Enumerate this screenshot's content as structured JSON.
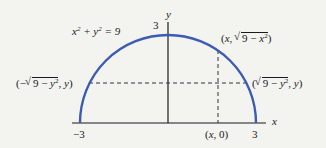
{
  "diagram": {
    "type": "semicircle-region",
    "equation": "x² + y² = 9",
    "radius": 3,
    "colors": {
      "curve": "#3b5bb5",
      "axes": "#1a1a1a",
      "dashed": "#333333",
      "background": "#f3f3f0"
    },
    "axes": {
      "x_label": "x",
      "y_label": "y"
    },
    "ticks": {
      "x_neg": "−3",
      "x_pos": "3",
      "y_top": "3"
    },
    "points": {
      "top": "(x, √(9 − x²))",
      "left": "(−√(9 − y²), y)",
      "right": "(√(9 − y²), y)",
      "base": "(x, 0)"
    }
  }
}
